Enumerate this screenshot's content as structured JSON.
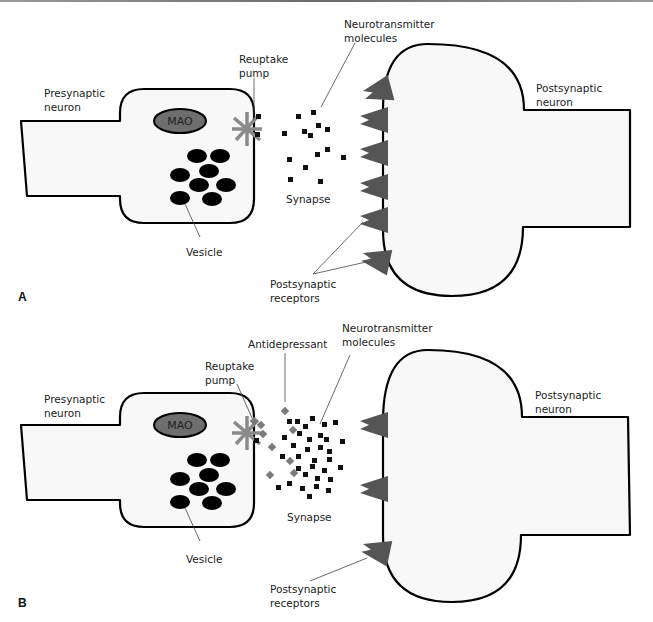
{
  "colors": {
    "membrane_fill": "#f8f8f8",
    "outline": "#000000",
    "receptor": "#555555",
    "mao_fill": "#6e6e6e",
    "pump": "#888888",
    "neurotransmitter": "#111111",
    "antidepressant": "#7a7a7a"
  },
  "panel_a": {
    "panel_label": "A",
    "presynaptic_label": [
      "Presynaptic",
      "neuron"
    ],
    "mao_label": "MAO",
    "reuptake_label": [
      "Reuptake",
      "pump"
    ],
    "neurotransmitter_label": [
      "Neurotransmitter",
      "molecules"
    ],
    "synapse_label": "Synapse",
    "vesicle_label": "Vesicle",
    "postsynaptic_receptors_label": [
      "Postsynaptic",
      "receptors"
    ],
    "postsynaptic_neuron_label": [
      "Postsynaptic",
      "neuron"
    ],
    "receptor_count": 6
  },
  "panel_b": {
    "panel_label": "B",
    "presynaptic_label": [
      "Presynaptic",
      "neuron"
    ],
    "mao_label": "MAO",
    "reuptake_label": [
      "Reuptake",
      "pump"
    ],
    "antidepressant_label": "Antidepressant",
    "neurotransmitter_label": [
      "Neurotransmitter",
      "molecules"
    ],
    "synapse_label": "Synapse",
    "vesicle_label": "Vesicle",
    "postsynaptic_receptors_label": [
      "Postsynaptic",
      "receptors"
    ],
    "postsynaptic_neuron_label": [
      "Postsynaptic",
      "neuron"
    ],
    "receptor_count": 3
  }
}
